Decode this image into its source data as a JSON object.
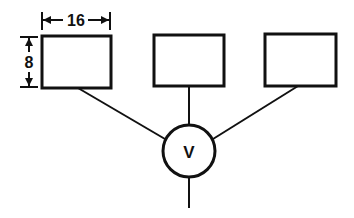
{
  "diagram": {
    "width_label": "16",
    "height_label": "8",
    "center_label": "V",
    "boxes": [
      {
        "x": 42,
        "y": 36,
        "w": 69,
        "h": 52
      },
      {
        "x": 154,
        "y": 35,
        "w": 70,
        "h": 51
      },
      {
        "x": 265,
        "y": 34,
        "w": 71,
        "h": 52
      }
    ],
    "node": {
      "cx": 189,
      "cy": 151,
      "r": 26
    },
    "colors": {
      "stroke": "#111111",
      "background": "#ffffff"
    }
  }
}
